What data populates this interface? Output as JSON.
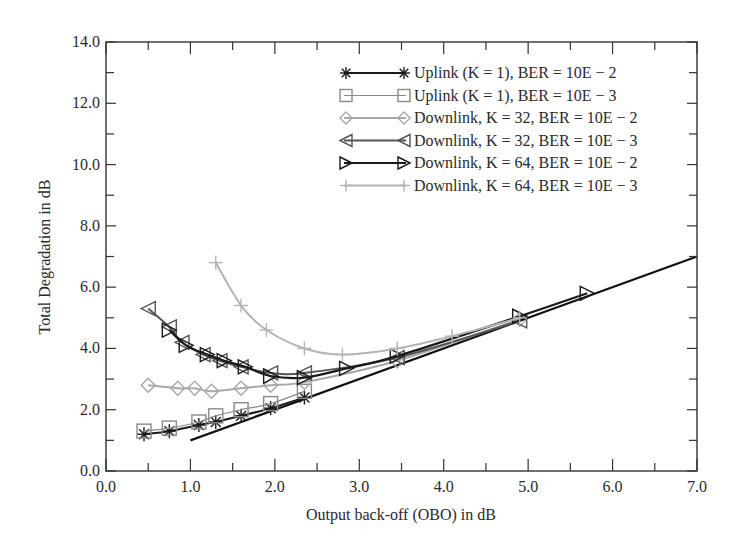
{
  "chart_data": {
    "type": "line",
    "title": "",
    "xlabel": "Output back-off (OBO) in dB",
    "ylabel": "Total Degradation in dB",
    "xlim": [
      0.0,
      7.0
    ],
    "ylim": [
      0.0,
      14.0
    ],
    "xticks": [
      "0.0",
      "1.0",
      "2.0",
      "3.0",
      "4.0",
      "5.0",
      "6.0",
      "7.0"
    ],
    "yticks": [
      "0.0",
      "2.0",
      "4.0",
      "6.0",
      "8.0",
      "10.0",
      "12.0",
      "14.0"
    ],
    "grid": false,
    "legend_position": "upper right",
    "series": [
      {
        "name": "Uplink (K = 1), BER = 10E − 2",
        "marker": "asterisk",
        "color": "#1a1a1a",
        "line_width": 2,
        "x": [
          0.45,
          0.75,
          1.1,
          1.3,
          1.6,
          1.95,
          2.35
        ],
        "y": [
          1.2,
          1.3,
          1.5,
          1.6,
          1.8,
          2.05,
          2.4
        ]
      },
      {
        "name": "Uplink (K = 1), BER = 10E − 3",
        "marker": "square",
        "color": "#8a8a8a",
        "line_width": 1.2,
        "x": [
          0.45,
          0.75,
          1.1,
          1.3,
          1.6,
          1.95,
          2.35
        ],
        "y": [
          1.3,
          1.4,
          1.6,
          1.8,
          2.0,
          2.2,
          2.6
        ]
      },
      {
        "name": "Downlink, K = 32, BER = 10E − 2",
        "marker": "diamond",
        "color": "#a8a8a8",
        "line_width": 2,
        "x": [
          0.5,
          0.85,
          1.05,
          1.25,
          1.6,
          1.95,
          2.35,
          3.45,
          4.9
        ],
        "y": [
          2.8,
          2.7,
          2.7,
          2.6,
          2.7,
          2.8,
          2.9,
          3.6,
          4.95
        ]
      },
      {
        "name": "Downlink, K = 32, BER = 10E − 3",
        "marker": "triangle-left",
        "color": "#555555",
        "line_width": 2,
        "x": [
          0.5,
          0.75,
          0.9,
          1.15,
          1.35,
          1.6,
          1.95,
          2.35,
          3.45,
          4.9
        ],
        "y": [
          5.3,
          4.7,
          4.2,
          3.8,
          3.6,
          3.4,
          3.2,
          3.2,
          3.7,
          4.9
        ]
      },
      {
        "name": "Downlink, K = 64, BER = 10E − 2",
        "marker": "triangle-right",
        "color": "#1a1a1a",
        "line_width": 2.2,
        "x": [
          0.75,
          0.95,
          1.2,
          1.4,
          1.65,
          1.95,
          2.35,
          2.85,
          3.45,
          4.9,
          5.7
        ],
        "y": [
          4.6,
          4.1,
          3.8,
          3.6,
          3.4,
          3.1,
          3.05,
          3.35,
          3.75,
          5.05,
          5.8
        ]
      },
      {
        "name": "Downlink, K = 64, BER = 10E − 3",
        "marker": "plus",
        "color": "#b4b4b4",
        "line_width": 2,
        "x": [
          1.3,
          1.6,
          1.9,
          2.35,
          2.8,
          3.45,
          4.1,
          4.9
        ],
        "y": [
          6.8,
          5.4,
          4.6,
          4.0,
          3.8,
          4.0,
          4.4,
          5.0
        ]
      }
    ],
    "reference_line": {
      "name": "OBO (y = x)",
      "color": "#111111",
      "x": [
        1.0,
        7.0
      ],
      "y": [
        1.0,
        7.0
      ]
    }
  }
}
